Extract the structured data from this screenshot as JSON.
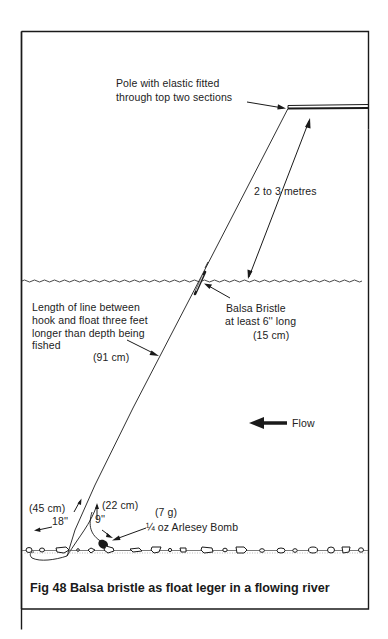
{
  "figure": {
    "caption": "Fig 48 Balsa bristle as float leger in a flowing river"
  },
  "labels": {
    "pole_line1": "Pole with elastic fitted",
    "pole_line2": "through top two sections",
    "distance": "2 to 3 metres",
    "float_line1": "Balsa Bristle",
    "float_line2": "at least 6'' long",
    "float_metric": "(15 cm)",
    "line_length_1": "Length of line between",
    "line_length_2": "hook and float three feet",
    "line_length_3": "longer than depth being",
    "line_length_4": "fished",
    "line_length_metric": "(91 cm)",
    "flow": "Flow",
    "hooklength_metric": "(45 cm)",
    "hooklength": "18''",
    "bomb_link_metric": "(22 cm)",
    "bomb_link": "9''",
    "bomb_weight_metric": "(7 g)",
    "bomb": "¼ oz Arlesey Bomb"
  },
  "colors": {
    "ink": "#1a1a1a",
    "paper": "#ffffff"
  }
}
